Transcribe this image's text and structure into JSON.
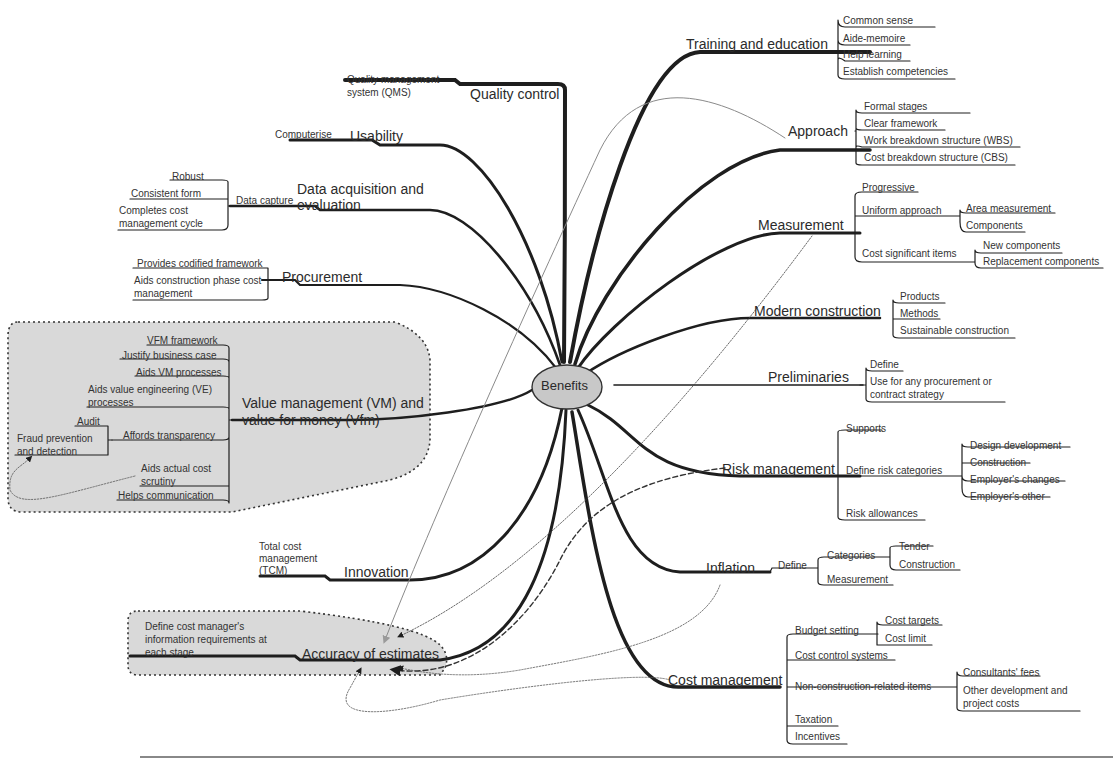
{
  "diagram": {
    "type": "mind-map",
    "center": "Benefits",
    "branches": [
      {
        "label": "Training and education",
        "children": [
          "Common sense",
          "Aide-memoire",
          "Help learning",
          "Establish competencies"
        ]
      },
      {
        "label": "Approach",
        "children": [
          "Formal stages",
          "Clear framework",
          "Work breakdown structure (WBS)",
          "Cost breakdown structure (CBS)"
        ]
      },
      {
        "label": "Measurement",
        "children": [
          {
            "label": "Progressive"
          },
          {
            "label": "Uniform approach",
            "children": [
              "Area measurement",
              "Components"
            ]
          },
          {
            "label": "Cost significant items",
            "children": [
              "New components",
              "Replacement components"
            ]
          }
        ]
      },
      {
        "label": "Modern construction",
        "children": [
          "Products",
          "Methods",
          "Sustainable construction"
        ]
      },
      {
        "label": "Preliminaries",
        "children": [
          "Define",
          "Use for any procurement or contract strategy"
        ]
      },
      {
        "label": "Risk management",
        "children": [
          {
            "label": "Supports"
          },
          {
            "label": "Define risk categories",
            "children": [
              "Design development",
              "Construction",
              "Employer's changes",
              "Employer's other"
            ]
          },
          {
            "label": "Risk allowances"
          }
        ]
      },
      {
        "label": "Inflation",
        "children": [
          {
            "label": "Define",
            "children": [
              {
                "label": "Categories",
                "children": [
                  "Tender",
                  "Construction"
                ]
              },
              {
                "label": "Measurement"
              }
            ]
          }
        ]
      },
      {
        "label": "Cost management",
        "children": [
          {
            "label": "Budget setting",
            "children": [
              "Cost targets",
              "Cost limit"
            ]
          },
          {
            "label": "Cost control systems"
          },
          {
            "label": "Non-construction-related items",
            "children": [
              "Consultants' fees",
              "Other development and project costs"
            ]
          },
          {
            "label": "Taxation"
          },
          {
            "label": "Incentives"
          }
        ]
      },
      {
        "label": "Quality control",
        "children": [
          "Quality management system (QMS)"
        ]
      },
      {
        "label": "Usability",
        "children": [
          "Computerise"
        ]
      },
      {
        "label": "Data acquisition and evaluation",
        "children": [
          {
            "label": "Data capture",
            "children": [
              "Robust",
              "Consistent form",
              "Completes cost management cycle"
            ]
          }
        ]
      },
      {
        "label": "Procurement",
        "children": [
          "Provides codified framework",
          "Aids construction phase cost management"
        ]
      },
      {
        "label": "Value management (VM) and value for money (Vfm)",
        "highlighted": true,
        "children": [
          {
            "label": "VFM framework"
          },
          {
            "label": "Justify business case"
          },
          {
            "label": "Aids VM processes"
          },
          {
            "label": "Aids value engineering (VE) processes"
          },
          {
            "label": "Affords transparency",
            "children": [
              "Audit",
              "Fraud prevention and detection"
            ]
          },
          {
            "label": "Aids actual cost scrutiny"
          },
          {
            "label": "Helps communication"
          }
        ]
      },
      {
        "label": "Innovation",
        "children": [
          "Total cost management (TCM)"
        ]
      },
      {
        "label": "Accuracy of estimates",
        "highlighted": true,
        "children": [
          "Define cost manager's information requirements at each stage"
        ]
      }
    ],
    "cross_links_to": "Accuracy of estimates",
    "cross_links_from": [
      "Approach",
      "Measurement",
      "Risk management",
      "Inflation",
      "Cost management"
    ]
  },
  "labels": {
    "center": "Benefits",
    "training": "Training and education",
    "tr1": "Common sense",
    "tr2": "Aide-memoire",
    "tr3": "Help learning",
    "tr4": "Establish competencies",
    "approach": "Approach",
    "ap1": "Formal stages",
    "ap2": "Clear framework",
    "ap3": "Work breakdown structure (WBS)",
    "ap4": "Cost breakdown structure (CBS)",
    "measurement": "Measurement",
    "me1": "Progressive",
    "me2": "Uniform approach",
    "me2a": "Area measurement",
    "me2b": "Components",
    "me3": "Cost significant items",
    "me3a": "New components",
    "me3b": "Replacement components",
    "modern": "Modern construction",
    "mo1": "Products",
    "mo2": "Methods",
    "mo3": "Sustainable construction",
    "prelim": "Preliminaries",
    "pr1": "Define",
    "pr2a": "Use for any procurement or",
    "pr2b": "contract strategy",
    "risk": "Risk management",
    "ri1": "Supports",
    "ri2": "Define risk categories",
    "ri2a": "Design development",
    "ri2b": "Construction",
    "ri2c": "Employer's changes",
    "ri2d": "Employer's other",
    "ri3": "Risk allowances",
    "inflation": "Inflation",
    "in1": "Define",
    "in1a": "Categories",
    "in1a1": "Tender",
    "in1a2": "Construction",
    "in1b": "Measurement",
    "costmgmt": "Cost management",
    "cm1": "Budget setting",
    "cm1a": "Cost targets",
    "cm1b": "Cost limit",
    "cm2": "Cost control systems",
    "cm3": "Non-construction-related items",
    "cm3a": "Consultants' fees",
    "cm3b1": "Other development and",
    "cm3b2": "project costs",
    "cm4": "Taxation",
    "cm5": "Incentives",
    "quality": "Quality control",
    "qu1a": "Quality management",
    "qu1b": "system (QMS)",
    "usability": "Usability",
    "us1": "Computerise",
    "dataacq1": "Data acquisition and",
    "dataacq2": "evaluation",
    "da1": "Data capture",
    "da1a": "Robust",
    "da1b": "Consistent form",
    "da1c1": "Completes cost",
    "da1c2": "management cycle",
    "procurement": "Procurement",
    "pc1": "Provides codified framework",
    "pc2a": "Aids construction phase cost",
    "pc2b": "management",
    "vm1": "Value management (VM) and",
    "vm2": "value for money (Vfm)",
    "vmc1": "VFM framework",
    "vmc2": "Justify business case",
    "vmc3": "Aids VM processes",
    "vmc4a": "Aids value engineering (VE)",
    "vmc4b": "processes",
    "vmc5": "Affords transparency",
    "vmc5a": "Audit",
    "vmc5b1": "Fraud prevention",
    "vmc5b2": "and detection",
    "vmc6a": "Aids actual cost",
    "vmc6b": "scrutiny",
    "vmc7": "Helps communication",
    "innovation": "Innovation",
    "inn1a": "Total cost",
    "inn1b": "management",
    "inn1c": "(TCM)",
    "accuracy": "Accuracy of estimates",
    "ac1a": "Define cost manager's",
    "ac1b": "information requirements at",
    "ac1c": "each stage"
  },
  "colors": {
    "line": "#1e1e1e",
    "highlight_fill": "#d9d9d9",
    "center_fill": "#c8c8c8",
    "crosslink_gray": "#8a8a8a"
  }
}
